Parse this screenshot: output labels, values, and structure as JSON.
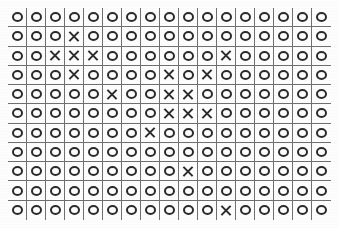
{
  "page": {
    "background_color": "#fdfdfd",
    "grid_line_color": "#6f6f6f",
    "mark_color": "#2b2b2b"
  },
  "grid": {
    "rows": 11,
    "columns": 17,
    "symbols": {
      "o": "circle-glyph",
      "x": "cross-glyph"
    },
    "cells": [
      [
        "o",
        "o",
        "o",
        "o",
        "o",
        "o",
        "o",
        "o",
        "o",
        "o",
        "o",
        "o",
        "o",
        "o",
        "o",
        "o",
        "o"
      ],
      [
        "o",
        "o",
        "o",
        "x",
        "o",
        "o",
        "o",
        "o",
        "o",
        "o",
        "o",
        "o",
        "o",
        "o",
        "o",
        "o",
        "o"
      ],
      [
        "o",
        "o",
        "x",
        "x",
        "x",
        "o",
        "o",
        "o",
        "o",
        "o",
        "o",
        "x",
        "o",
        "o",
        "o",
        "o",
        "o"
      ],
      [
        "o",
        "o",
        "o",
        "x",
        "o",
        "o",
        "o",
        "o",
        "x",
        "o",
        "x",
        "o",
        "o",
        "o",
        "o",
        "o",
        "o"
      ],
      [
        "o",
        "o",
        "o",
        "o",
        "o",
        "x",
        "o",
        "o",
        "x",
        "x",
        "o",
        "o",
        "o",
        "o",
        "o",
        "o",
        "o"
      ],
      [
        "o",
        "o",
        "o",
        "o",
        "o",
        "o",
        "o",
        "o",
        "x",
        "x",
        "x",
        "o",
        "o",
        "o",
        "o",
        "o",
        "o"
      ],
      [
        "o",
        "o",
        "o",
        "o",
        "o",
        "o",
        "o",
        "x",
        "o",
        "o",
        "o",
        "o",
        "o",
        "o",
        "o",
        "o",
        "o"
      ],
      [
        "o",
        "o",
        "o",
        "o",
        "o",
        "o",
        "o",
        "o",
        "o",
        "o",
        "o",
        "o",
        "o",
        "o",
        "o",
        "o",
        "o"
      ],
      [
        "o",
        "o",
        "o",
        "o",
        "o",
        "o",
        "o",
        "o",
        "o",
        "x",
        "o",
        "o",
        "o",
        "o",
        "o",
        "o",
        "o"
      ],
      [
        "o",
        "o",
        "o",
        "o",
        "o",
        "o",
        "o",
        "o",
        "o",
        "o",
        "o",
        "o",
        "o",
        "o",
        "o",
        "o",
        "o"
      ],
      [
        "o",
        "o",
        "o",
        "o",
        "o",
        "o",
        "o",
        "o",
        "o",
        "o",
        "o",
        "x",
        "o",
        "o",
        "o",
        "o",
        "o"
      ]
    ]
  }
}
